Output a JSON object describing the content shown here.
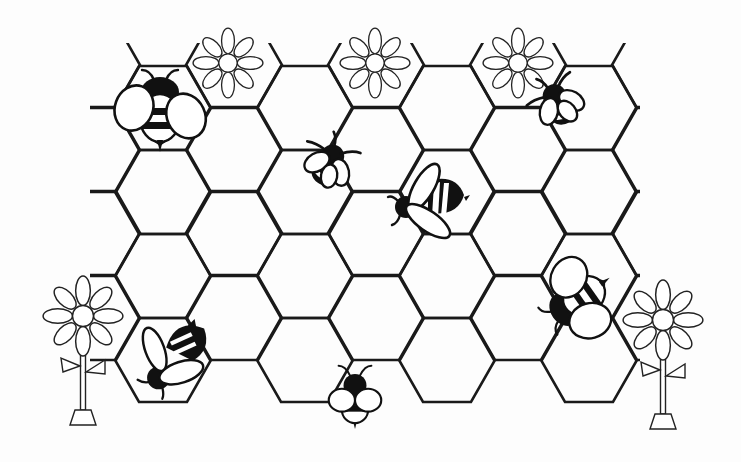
{
  "scene": {
    "title": "Bees on a honeycomb",
    "background_color": "#ffffff",
    "ink_color": "#111111"
  },
  "honeycomb": {
    "hex_side": 48,
    "column_pitch": 71,
    "row_pitch": 84.5,
    "even_columns": [
      {
        "cx": 163,
        "rows": [
          108,
          192,
          276,
          360
        ]
      },
      {
        "cx": 305,
        "rows": [
          108,
          192,
          276,
          360
        ]
      },
      {
        "cx": 447,
        "rows": [
          108,
          192,
          276,
          360
        ]
      },
      {
        "cx": 589,
        "rows": [
          108,
          192,
          276,
          360
        ]
      }
    ],
    "odd_columns": [
      {
        "cx": 92,
        "rows": [
          65,
          150,
          233,
          318
        ]
      },
      {
        "cx": 234,
        "rows": [
          65,
          150,
          233,
          318
        ]
      },
      {
        "cx": 376,
        "rows": [
          65,
          150,
          233,
          318
        ]
      },
      {
        "cx": 518,
        "rows": [
          65,
          150,
          233,
          318
        ]
      },
      {
        "cx": 660,
        "rows": [
          65,
          150,
          233,
          318
        ]
      }
    ],
    "clip": {
      "x": 90,
      "y": 43,
      "width": 550,
      "height": 362
    }
  },
  "top_flowers": [
    {
      "name": "flower-cell-1",
      "cx": 228,
      "cy": 63
    },
    {
      "name": "flower-cell-2",
      "cx": 375,
      "cy": 63
    },
    {
      "name": "flower-cell-3",
      "cx": 518,
      "cy": 63
    }
  ],
  "standing_flowers": [
    {
      "name": "left-flower",
      "cx": 83,
      "cy": 316,
      "stem_bottom": 410
    },
    {
      "name": "right-flower",
      "cx": 663,
      "cy": 320,
      "stem_bottom": 414
    }
  ],
  "bees": [
    {
      "name": "bee-top-left",
      "style": "wide",
      "x": 160,
      "y": 110,
      "rotate": 0,
      "scale": 1.0
    },
    {
      "name": "bee-center-left",
      "style": "top",
      "x": 330,
      "y": 163,
      "rotate": 200,
      "scale": 0.9
    },
    {
      "name": "bee-center",
      "style": "side",
      "x": 428,
      "y": 203,
      "rotate": 0,
      "scale": 1.0
    },
    {
      "name": "bee-top-right",
      "style": "top",
      "x": 558,
      "y": 102,
      "rotate": 150,
      "scale": 0.9
    },
    {
      "name": "bee-bottom-left",
      "style": "side-flip",
      "x": 168,
      "y": 357,
      "rotate": 0,
      "scale": 0.95
    },
    {
      "name": "bee-bottom-center",
      "style": "wide-up",
      "x": 355,
      "y": 392,
      "rotate": 0,
      "scale": 0.82
    },
    {
      "name": "bee-right",
      "style": "wide",
      "x": 578,
      "y": 300,
      "rotate": -125,
      "scale": 0.92
    }
  ]
}
